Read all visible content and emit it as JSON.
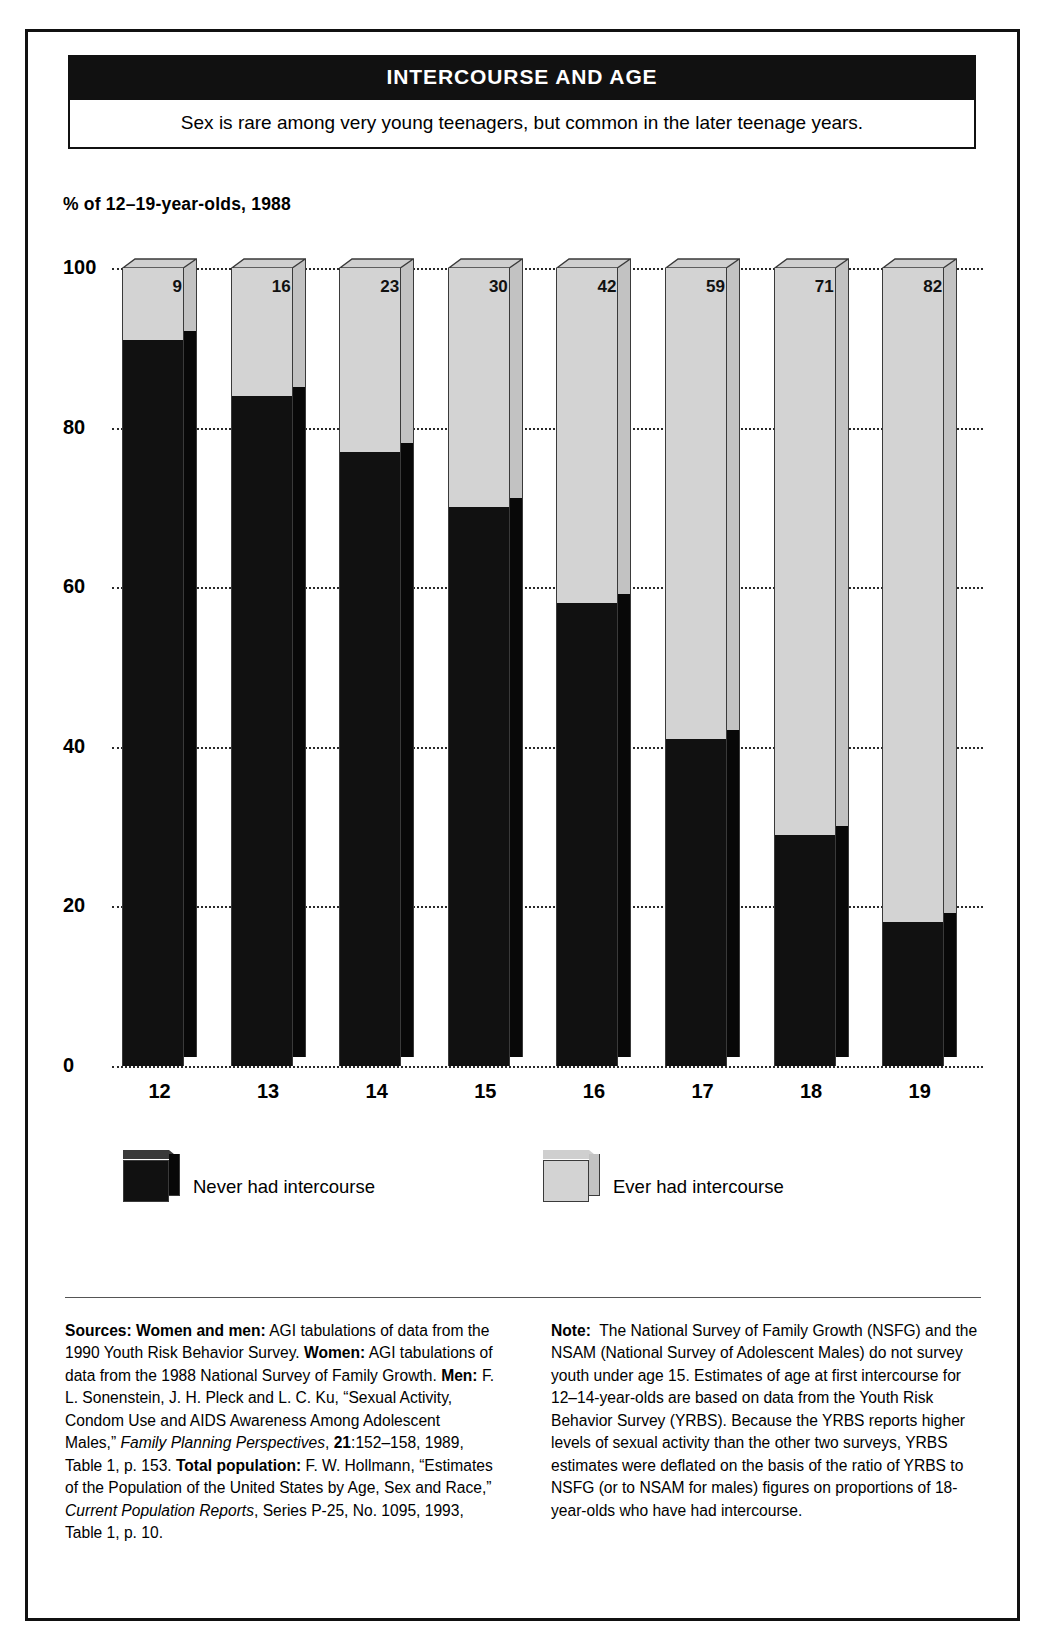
{
  "header": {
    "title": "INTERCOURSE AND AGE",
    "subtitle": "Sex is rare among very young teenagers, but common in the later teenage years."
  },
  "chart_data": {
    "type": "bar",
    "subtype": "stacked-3d-column",
    "title": "INTERCOURSE AND AGE",
    "subtitle": "Sex is rare among very young teenagers, but common in the later teenage years.",
    "ylabel": "% of 12–19-year-olds, 1988",
    "xlabel": "",
    "categories": [
      "12",
      "13",
      "14",
      "15",
      "16",
      "17",
      "18",
      "19"
    ],
    "ylim": [
      0,
      100
    ],
    "yticks": [
      "0",
      "20",
      "40",
      "60",
      "80",
      "100"
    ],
    "grid": true,
    "legend_position": "below-plot",
    "data_labels": [
      "9",
      "16",
      "23",
      "30",
      "42",
      "59",
      "71",
      "82"
    ],
    "series": [
      {
        "name": "Never had intercourse",
        "color": "#111111",
        "values": [
          91,
          84,
          77,
          70,
          58,
          41,
          29,
          18
        ]
      },
      {
        "name": "Ever had intercourse",
        "color": "#d3d3d3",
        "values": [
          9,
          16,
          23,
          30,
          42,
          59,
          71,
          82
        ]
      }
    ]
  },
  "axis": {
    "caption": "%  of 12–19-year-olds, 1988"
  },
  "legend": {
    "never_label": "Never had intercourse",
    "ever_label": "Ever had intercourse"
  },
  "footnotes": {
    "sources_html": "<b>Sources: Women and men:</b> AGI tabulations of data from the 1990 Youth Risk Behavior Survey. <b>Women:</b> AGI tabulations of data from the 1988 National Survey of Family Growth. <b>Men:</b> F. L. Sonenstein, J. H. Pleck and L. C. Ku, “Sexual Activity, Condom Use and AIDS Awareness Among Adolescent Males,” <i>Family Planning Perspectives</i>, <b>21</b>:152–158, 1989, Table 1, p. 153. <b>Total population:</b> F. W. Hollmann, “Estimates of the Population of the United States by Age, Sex and Race,” <i>Current Population Reports</i>, Series P-25, No. 1095, 1993, Table 1, p. 10.",
    "note_html": "<b>Note:</b>&nbsp; The National Survey of Family Growth (NSFG) and the NSAM (National Survey of Adolescent Males) do not survey youth under age 15. Estimates of age at first intercourse for 12–14-year-olds are based on data from the Youth Risk Behavior Survey (YRBS). Because the YRBS reports higher levels of sexual activity than the other two surveys, YRBS estimates were deflated on the basis of the ratio of YRBS to NSFG (or to NSAM for males) figures on proportions of 18-year-olds who have had intercourse."
  },
  "colors": {
    "never": "#111111",
    "ever": "#d3d3d3",
    "frame": "#111111",
    "grid": "#2a2a2a"
  }
}
